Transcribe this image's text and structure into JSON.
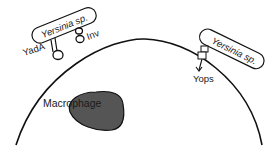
{
  "diagram": {
    "labels": {
      "bacterium_left": "Yersinia sp.",
      "bacterium_right": "Yersinia sp.",
      "yada": "YadA",
      "inv": "Inv",
      "yops": "Yops",
      "macrophage": "Macrophage"
    },
    "colors": {
      "stroke": "#111111",
      "nucleus_fill": "#555555",
      "background": "#ffffff"
    }
  }
}
